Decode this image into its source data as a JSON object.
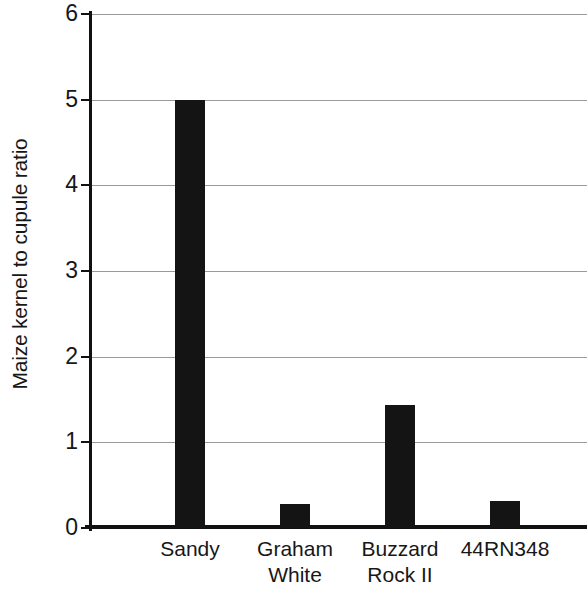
{
  "chart_data": {
    "type": "bar",
    "title": "",
    "subtitle": "",
    "xlabel": "",
    "ylabel": "Maize kernel to cupule ratio",
    "categories": [
      "Sandy",
      "Graham White",
      "Buzzard Rock II",
      "44RN348"
    ],
    "category_lines": [
      [
        "Sandy",
        ""
      ],
      [
        "Graham",
        "White"
      ],
      [
        "Buzzard",
        "Rock II"
      ],
      [
        "44RN348",
        ""
      ]
    ],
    "values": [
      5.0,
      0.28,
      1.44,
      0.32
    ],
    "ylim": [
      0,
      6
    ],
    "ytick_labels": [
      "0",
      "1",
      "2",
      "3",
      "4",
      "5",
      "6"
    ],
    "ytick_values": [
      0,
      1,
      2,
      3,
      4,
      5,
      6
    ],
    "grid": true,
    "grid_axis": "y",
    "legend": "none",
    "bar_color": "#141414",
    "grid_color": "#9a9a9a",
    "axis_color": "#111111",
    "background_color": "#ffffff"
  }
}
